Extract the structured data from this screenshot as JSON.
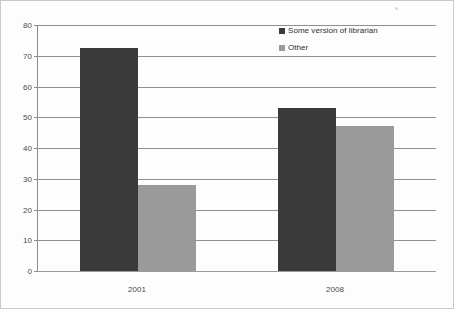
{
  "chart_data": {
    "type": "bar",
    "title": "",
    "xlabel": "",
    "ylabel": "",
    "categories": [
      "2001",
      "2008"
    ],
    "series": [
      {
        "name": "Some version of librarian",
        "color": "#3a3a3a",
        "values": [
          72.5,
          53
        ]
      },
      {
        "name": "Other",
        "color": "#9a9a9a",
        "values": [
          28,
          47
        ]
      }
    ],
    "ylim": [
      0,
      80
    ],
    "ytick_step": 10,
    "yticks": [
      "0",
      "10",
      "20",
      "30",
      "40",
      "50",
      "60",
      "70",
      "80"
    ],
    "grid": true,
    "legend_position": "top-right"
  },
  "figure": {
    "background": "#fdfdfd",
    "border_color": "#c9c9c9",
    "axis_color": "#8f8f8f",
    "tick_text_color": "#4a4a4a"
  }
}
